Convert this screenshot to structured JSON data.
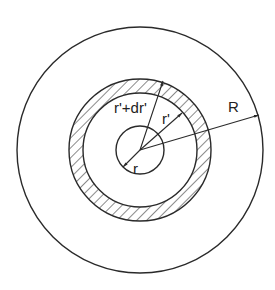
{
  "diagram": {
    "type": "concentric-circles",
    "center": [
      140,
      150
    ],
    "stroke_color": "#2a2a2a",
    "circles": [
      {
        "name": "outer-sphere",
        "radius": 123,
        "label": "R"
      },
      {
        "name": "shell-outer",
        "radius": 71,
        "label": "r'+dr'"
      },
      {
        "name": "shell-inner",
        "radius": 57,
        "label": "r'"
      },
      {
        "name": "inner-sphere",
        "radius": 24,
        "label": "r"
      }
    ],
    "hatched_region": "shell between r' and r'+dr'",
    "labels": {
      "R": "R",
      "r_prime_plus_dr_prime": "r'+dr'",
      "r_prime": "r'",
      "r": "r"
    }
  }
}
